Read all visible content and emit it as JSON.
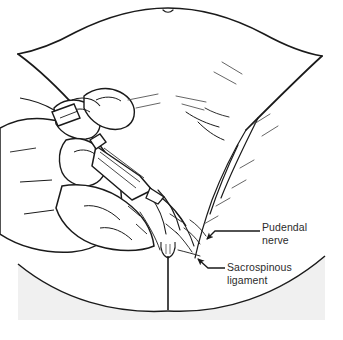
{
  "figure": {
    "name": "pudendal-nerve-block-illustration",
    "background_color": "#ffffff",
    "ink_color": "#1a1a1a",
    "drape_color": "#f0f0f0",
    "text_color": "#2b2b2b"
  },
  "labels": [
    {
      "id": "pudendal-nerve",
      "line1": "Pudendal",
      "line2": "nerve",
      "x": 262,
      "y": 221,
      "leader": {
        "from_x": 260,
        "to_x": 208,
        "y": 231,
        "arrow_x": 205,
        "arrow_y": 240
      }
    },
    {
      "id": "sacrospinous-ligament",
      "line1": "Sacrospinous",
      "line2": "ligament",
      "x": 227,
      "y": 261,
      "leader": {
        "from_x": 225,
        "to_x": 200,
        "y": 268,
        "arrow_x": 196,
        "arrow_y": 258
      }
    }
  ],
  "anatomy": {
    "regions": [
      "abdomen",
      "left-thigh",
      "right-thigh",
      "perineum",
      "gluteal-cleft",
      "buttock",
      "labia"
    ]
  },
  "instruments": {
    "items": [
      "syringe-barrel",
      "syringe-plunger",
      "needle-guide",
      "needle-tip",
      "gloved-hand"
    ]
  }
}
